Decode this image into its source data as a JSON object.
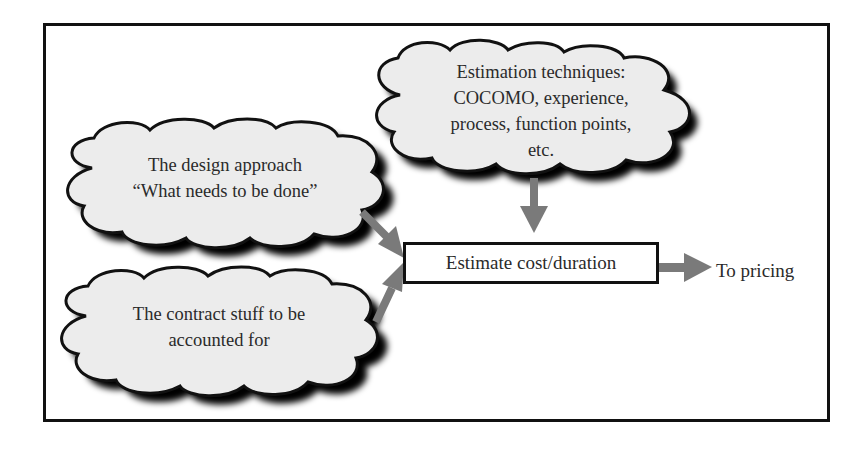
{
  "diagram": {
    "type": "flow",
    "colors": {
      "frame": "#111111",
      "cloud_fill": "#ececec",
      "cloud_outline": "#111111",
      "cloud_shadow": "#000000",
      "arrow": "#7a7a7a",
      "text": "#2a2a2a"
    },
    "clouds": [
      {
        "id": "estimation-techniques",
        "lines": [
          "Estimation techniques:",
          "COCOMO, experience,",
          "process, function points,",
          "etc."
        ]
      },
      {
        "id": "design-approach",
        "lines": [
          "The design approach",
          "“What needs to be done”"
        ]
      },
      {
        "id": "contract-stuff",
        "lines": [
          "The contract stuff to be",
          "accounted for"
        ]
      }
    ],
    "process_box": {
      "label": "Estimate cost/duration"
    },
    "output": {
      "label": "To pricing"
    },
    "edges": [
      {
        "from": "estimation-techniques",
        "to": "process_box"
      },
      {
        "from": "design-approach",
        "to": "process_box"
      },
      {
        "from": "contract-stuff",
        "to": "process_box"
      },
      {
        "from": "process_box",
        "to": "output"
      }
    ]
  }
}
